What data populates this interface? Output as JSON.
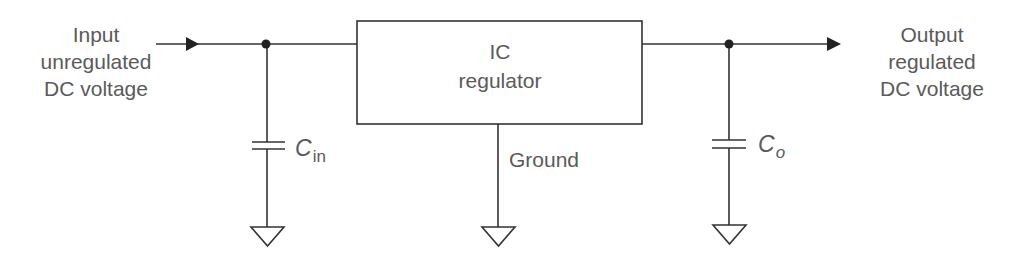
{
  "diagram": {
    "type": "block/circuit diagram",
    "colors": {
      "line": "#333333",
      "text": "#5a5a5a",
      "background": "#ffffff"
    },
    "input_label": [
      "Input",
      "unregulated",
      "DC voltage"
    ],
    "output_label": [
      "Output",
      "regulated",
      "DC voltage"
    ],
    "block": {
      "label_line1": "IC",
      "label_line2": "regulator"
    },
    "ground_label": "Ground",
    "input_capacitor": {
      "symbol": "C",
      "subscript": "in"
    },
    "output_capacitor": {
      "symbol": "C",
      "subscript": "o"
    },
    "components": [
      {
        "id": "input-node",
        "kind": "junction-dot"
      },
      {
        "id": "cin",
        "kind": "capacitor",
        "to": "ground"
      },
      {
        "id": "ic-regulator",
        "kind": "block"
      },
      {
        "id": "regulator-ground",
        "kind": "ground"
      },
      {
        "id": "output-node",
        "kind": "junction-dot"
      },
      {
        "id": "co",
        "kind": "capacitor",
        "to": "ground"
      }
    ]
  }
}
